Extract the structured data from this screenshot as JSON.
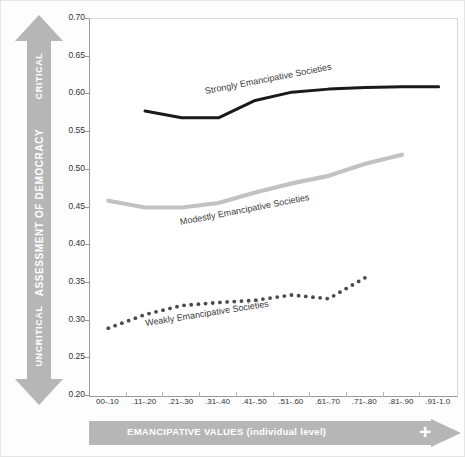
{
  "axes": {
    "vertical_arrow": {
      "top_label": "CRITICAL",
      "middle_label": "ASSESSMENT OF DEMOCRACY",
      "bottom_label": "UNCRITICAL",
      "color": "#b6b6b6"
    },
    "horizontal_arrow": {
      "label": "EMANCIPATIVE VALUES (individual level)",
      "plus_sign": "+",
      "color": "#b6b6b6"
    }
  },
  "chart_data": {
    "type": "line",
    "title": "",
    "xlabel": "EMANCIPATIVE VALUES (individual level)",
    "ylabel": "ASSESSMENT OF DEMOCRACY",
    "categories": [
      "00-.10",
      ".11-.20",
      ".21-.30",
      ".31-.40",
      ".41-.50",
      ".51-.60",
      ".61-.70",
      ".71-.80",
      ".81-.90",
      ".91-1.0"
    ],
    "ylim": [
      0.2,
      0.7
    ],
    "yticks": [
      "0.20",
      "0.25",
      "0.30",
      "0.35",
      "0.40",
      "0.45",
      "0.50",
      "0.55",
      "0.60",
      "0.65",
      "0.70"
    ],
    "grid": false,
    "legend_position": "inline-labels",
    "series": [
      {
        "name": "Strongly Emancipative Societies",
        "color": "#1a1a1a",
        "style": "solid",
        "x": [
          ".11-.20",
          ".21-.30",
          ".31-.40",
          ".41-.50",
          ".51-.60",
          ".61-.70",
          ".71-.80",
          ".81-.90",
          ".91-1.0"
        ],
        "values": [
          0.578,
          0.569,
          0.569,
          0.592,
          0.603,
          0.607,
          0.609,
          0.61,
          0.61
        ]
      },
      {
        "name": "Modestly Emancipative Societies",
        "color": "#c2c2c2",
        "style": "solid",
        "x": [
          "00-.10",
          ".11-.20",
          ".21-.30",
          ".31-.40",
          ".41-.50",
          ".51-.60",
          ".61-.70",
          ".71-.80",
          ".81-.90"
        ],
        "values": [
          0.459,
          0.45,
          0.45,
          0.456,
          0.47,
          0.482,
          0.492,
          0.508,
          0.52
        ]
      },
      {
        "name": "Weakly Emancipative Societies",
        "color": "#4a4a4a",
        "style": "dotted",
        "x": [
          "00-.10",
          ".11-.20",
          ".21-.30",
          ".31-.40",
          ".41-.50",
          ".51-.60",
          ".61-.70",
          ".71-.80"
        ],
        "values": [
          0.29,
          0.308,
          0.32,
          0.324,
          0.327,
          0.334,
          0.329,
          0.357
        ]
      }
    ]
  }
}
